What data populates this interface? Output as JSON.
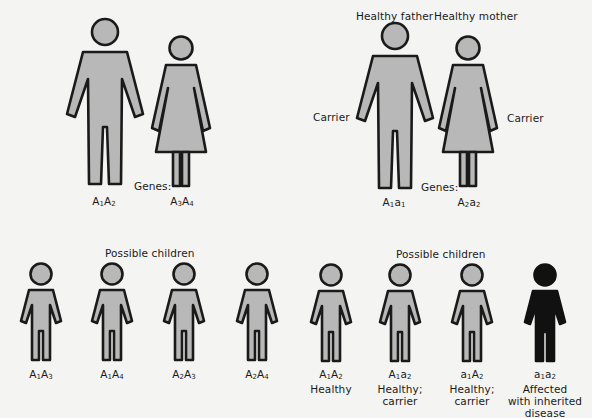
{
  "colors": {
    "background": "#f4f4f2",
    "figure_fill": "#b8b8b8",
    "figure_outline": "#1a1a1a",
    "affected_fill": "#111111"
  },
  "left_family": {
    "genes_label": "Genes:",
    "father": {
      "genotype": [
        [
          "A",
          "1"
        ],
        [
          "A",
          "2"
        ]
      ]
    },
    "mother": {
      "genotype": [
        [
          "A",
          "3"
        ],
        [
          "A",
          "4"
        ]
      ]
    },
    "children_title": "Possible children",
    "children": [
      {
        "genotype": [
          [
            "A",
            "1"
          ],
          [
            "A",
            "3"
          ]
        ],
        "status": ""
      },
      {
        "genotype": [
          [
            "A",
            "1"
          ],
          [
            "A",
            "4"
          ]
        ],
        "status": ""
      },
      {
        "genotype": [
          [
            "A",
            "2"
          ],
          [
            "A",
            "3"
          ]
        ],
        "status": ""
      },
      {
        "genotype": [
          [
            "A",
            "2"
          ],
          [
            "A",
            "4"
          ]
        ],
        "status": ""
      }
    ]
  },
  "right_family": {
    "father_title": "Healthy father",
    "mother_title": "Healthy mother",
    "father_side_label": "Carrier",
    "mother_side_label": "Carrier",
    "genes_label": "Genes:",
    "father": {
      "genotype": [
        [
          "A",
          "1"
        ],
        [
          "a",
          "1"
        ]
      ]
    },
    "mother": {
      "genotype": [
        [
          "A",
          "2"
        ],
        [
          "a",
          "2"
        ]
      ]
    },
    "children_title": "Possible children",
    "children": [
      {
        "genotype": [
          [
            "A",
            "1"
          ],
          [
            "A",
            "2"
          ]
        ],
        "status_lines": [
          "Healthy"
        ],
        "affected": false
      },
      {
        "genotype": [
          [
            "A",
            "1"
          ],
          [
            "a",
            "2"
          ]
        ],
        "status_lines": [
          "Healthy;",
          "carrier"
        ],
        "affected": false
      },
      {
        "genotype": [
          [
            "a",
            "1"
          ],
          [
            "A",
            "2"
          ]
        ],
        "status_lines": [
          "Healthy;",
          "carrier"
        ],
        "affected": false
      },
      {
        "genotype": [
          [
            "a",
            "1"
          ],
          [
            "a",
            "2"
          ]
        ],
        "status_lines": [
          "Affected",
          "with inherited",
          "disease"
        ],
        "affected": true
      }
    ]
  }
}
